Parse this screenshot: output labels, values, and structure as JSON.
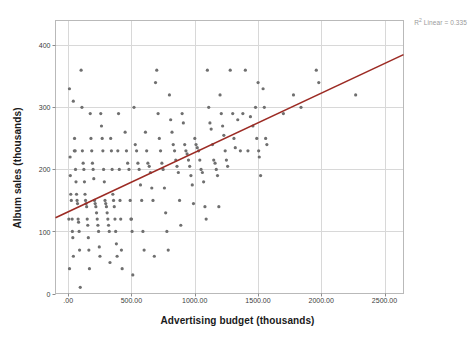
{
  "chart_data": {
    "type": "scatter",
    "title": "",
    "xlabel": "Advertising budget (thousands)",
    "ylabel": "Album sales (thousands)",
    "xlim": [
      -100,
      2650
    ],
    "ylim": [
      0,
      440
    ],
    "x_ticks": [
      0,
      500,
      1000,
      1500,
      2000,
      2500
    ],
    "x_tick_labels": [
      ".00",
      "500.00",
      "1000.00",
      "1500.00",
      "2000.00",
      "2500.00"
    ],
    "y_ticks": [
      0,
      100,
      200,
      300,
      400
    ],
    "y_tick_labels": [
      "0",
      "100",
      "200",
      "300",
      "400"
    ],
    "grid": true,
    "grid_color": "#d8d8d8",
    "point_color": "#6f6f6f",
    "point_size": 3.2,
    "legend": "none",
    "annotations": [
      {
        "name": "r-squared",
        "text": "R² Linear = 0.335",
        "value": 0.335,
        "color": "#9a9a9a"
      }
    ],
    "fit_line": {
      "type": "linear",
      "color": "#9c2b24",
      "width": 1.6,
      "x_start": -100,
      "x_end": 2650,
      "y_start": 122,
      "y_end": 385
    },
    "series": [
      {
        "name": "Album sales vs advertising budget",
        "points": [
          [
            10.26,
            330
          ],
          [
            5.52,
            120
          ],
          [
            10.65,
            40
          ],
          [
            40.74,
            310
          ],
          [
            50.44,
            250
          ],
          [
            15.3,
            220
          ],
          [
            17.24,
            190
          ],
          [
            20.6,
            160
          ],
          [
            25.1,
            150
          ],
          [
            31.5,
            120
          ],
          [
            33.2,
            100
          ],
          [
            36.8,
            90
          ],
          [
            41.2,
            60
          ],
          [
            48.8,
            230
          ],
          [
            55.4,
            230
          ],
          [
            58.3,
            200
          ],
          [
            62.1,
            180
          ],
          [
            66.2,
            160
          ],
          [
            70.4,
            150
          ],
          [
            74.1,
            145
          ],
          [
            78.5,
            120
          ],
          [
            82.3,
            115
          ],
          [
            86.6,
            100
          ],
          [
            90.2,
            70
          ],
          [
            95.6,
            10
          ],
          [
            102.4,
            360
          ],
          [
            108.9,
            300
          ],
          [
            112.3,
            230
          ],
          [
            118.5,
            210
          ],
          [
            124.1,
            200
          ],
          [
            128.8,
            180
          ],
          [
            133.2,
            160
          ],
          [
            137.5,
            150
          ],
          [
            141.8,
            145
          ],
          [
            146.2,
            140
          ],
          [
            150.6,
            120
          ],
          [
            155.1,
            110
          ],
          [
            159.4,
            90
          ],
          [
            163.8,
            70
          ],
          [
            168.2,
            40
          ],
          [
            174.5,
            290
          ],
          [
            180.2,
            250
          ],
          [
            186.4,
            230
          ],
          [
            191.8,
            210
          ],
          [
            197.2,
            200
          ],
          [
            202.6,
            185
          ],
          [
            208.1,
            150
          ],
          [
            213.5,
            145
          ],
          [
            218.9,
            140
          ],
          [
            224.3,
            130
          ],
          [
            229.7,
            120
          ],
          [
            235.1,
            110
          ],
          [
            240.5,
            100
          ],
          [
            245.9,
            75
          ],
          [
            251.3,
            60
          ],
          [
            257.6,
            290
          ],
          [
            263.2,
            270
          ],
          [
            268.8,
            250
          ],
          [
            274.4,
            230
          ],
          [
            280.1,
            200
          ],
          [
            285.7,
            180
          ],
          [
            291.3,
            150
          ],
          [
            296.9,
            145
          ],
          [
            302.5,
            140
          ],
          [
            308.1,
            130
          ],
          [
            313.7,
            120
          ],
          [
            319.3,
            110
          ],
          [
            324.9,
            100
          ],
          [
            330.5,
            50
          ],
          [
            336.2,
            250
          ],
          [
            341.8,
            230
          ],
          [
            347.4,
            200
          ],
          [
            353.1,
            160
          ],
          [
            358.7,
            150
          ],
          [
            364.3,
            140
          ],
          [
            369.9,
            120
          ],
          [
            375.5,
            100
          ],
          [
            381.1,
            80
          ],
          [
            386.8,
            60
          ],
          [
            392.4,
            230
          ],
          [
            398.2,
            290
          ],
          [
            404.1,
            200
          ],
          [
            409.8,
            150
          ],
          [
            415.4,
            120
          ],
          [
            421.1,
            70
          ],
          [
            426.7,
            40
          ],
          [
            450.3,
            260
          ],
          [
            460.8,
            230
          ],
          [
            470.2,
            210
          ],
          [
            480.6,
            200
          ],
          [
            490.1,
            150
          ],
          [
            495.8,
            120
          ],
          [
            500.4,
            120
          ],
          [
            505.2,
            100
          ],
          [
            510.9,
            30
          ],
          [
            520.5,
            300
          ],
          [
            530.2,
            240
          ],
          [
            540.8,
            230
          ],
          [
            551.3,
            210
          ],
          [
            560.9,
            200
          ],
          [
            571.4,
            175
          ],
          [
            581.1,
            150
          ],
          [
            590.8,
            100
          ],
          [
            600.3,
            70
          ],
          [
            610.7,
            260
          ],
          [
            620.4,
            230
          ],
          [
            630.1,
            210
          ],
          [
            640.7,
            205
          ],
          [
            650.2,
            195
          ],
          [
            660.8,
            170
          ],
          [
            670.3,
            150
          ],
          [
            680.9,
            60
          ],
          [
            690.5,
            340
          ],
          [
            700.2,
            360
          ],
          [
            710.8,
            290
          ],
          [
            720.4,
            250
          ],
          [
            730.1,
            230
          ],
          [
            740.7,
            210
          ],
          [
            750.3,
            200
          ],
          [
            760.9,
            170
          ],
          [
            770.5,
            130
          ],
          [
            780.1,
            100
          ],
          [
            790.8,
            70
          ],
          [
            800.4,
            320
          ],
          [
            810.1,
            280
          ],
          [
            820.7,
            260
          ],
          [
            830.3,
            240
          ],
          [
            840.9,
            230
          ],
          [
            850.5,
            215
          ],
          [
            860.1,
            205
          ],
          [
            870.8,
            195
          ],
          [
            880.4,
            150
          ],
          [
            890.1,
            110
          ],
          [
            900.7,
            290
          ],
          [
            910.3,
            275
          ],
          [
            920.9,
            240
          ],
          [
            930.5,
            230
          ],
          [
            940.1,
            225
          ],
          [
            950.8,
            215
          ],
          [
            960.4,
            205
          ],
          [
            970.1,
            190
          ],
          [
            980.7,
            175
          ],
          [
            990.3,
            145
          ],
          [
            1000.9,
            250
          ],
          [
            1010.5,
            240
          ],
          [
            1020.1,
            235
          ],
          [
            1030.8,
            230
          ],
          [
            1040.4,
            215
          ],
          [
            1050.1,
            200
          ],
          [
            1060.7,
            195
          ],
          [
            1070.3,
            180
          ],
          [
            1080.9,
            140
          ],
          [
            1090.5,
            120
          ],
          [
            1100.2,
            360
          ],
          [
            1110.8,
            300
          ],
          [
            1120.4,
            275
          ],
          [
            1130.1,
            265
          ],
          [
            1140.7,
            240
          ],
          [
            1150.3,
            215
          ],
          [
            1160.9,
            210
          ],
          [
            1170.5,
            200
          ],
          [
            1180.2,
            190
          ],
          [
            1190.8,
            140
          ],
          [
            1200.4,
            320
          ],
          [
            1210.1,
            290
          ],
          [
            1220.7,
            270
          ],
          [
            1230.3,
            255
          ],
          [
            1240.9,
            230
          ],
          [
            1250.5,
            215
          ],
          [
            1260.2,
            205
          ],
          [
            1280.8,
            360
          ],
          [
            1300.4,
            290
          ],
          [
            1310.1,
            250
          ],
          [
            1320.7,
            235
          ],
          [
            1340.3,
            280
          ],
          [
            1360.9,
            230
          ],
          [
            1380.5,
            290
          ],
          [
            1400.2,
            360
          ],
          [
            1420.8,
            230
          ],
          [
            1440.4,
            285
          ],
          [
            1460.1,
            270
          ],
          [
            1480.7,
            300
          ],
          [
            1490.3,
            250
          ],
          [
            1500.9,
            340
          ],
          [
            1505.5,
            230
          ],
          [
            1510.2,
            220
          ],
          [
            1520.8,
            190
          ],
          [
            1540.4,
            330
          ],
          [
            1550.1,
            300
          ],
          [
            1560.7,
            250
          ],
          [
            1570.3,
            240
          ],
          [
            1700.9,
            290
          ],
          [
            1780.5,
            320
          ],
          [
            1840.2,
            300
          ],
          [
            1960.8,
            360
          ],
          [
            1980.4,
            340
          ],
          [
            2271.9,
            320
          ]
        ]
      }
    ]
  },
  "axes": {
    "x_title": "Advertising budget (thousands)",
    "y_title": "Album sales (thousands)"
  },
  "annotation": {
    "r2_prefix": "R",
    "r2_sup": "2",
    "r2_text": " Linear = 0.335"
  }
}
